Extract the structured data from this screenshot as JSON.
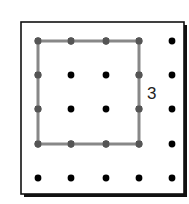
{
  "diagram": {
    "type": "dot-grid-square",
    "grid": {
      "rows": 5,
      "cols": 5,
      "xs": [
        38,
        71,
        106,
        139,
        172
      ],
      "ys": [
        41,
        75,
        109,
        144,
        178
      ],
      "dot_radius": 3.4,
      "dot_color": "#000000"
    },
    "frame": {
      "x": 21,
      "y": 22,
      "width": 163,
      "height": 172,
      "stroke": "#111111",
      "shadow_color": "#111111"
    },
    "square": {
      "from": {
        "col": 0,
        "row": 0
      },
      "to": {
        "col": 3,
        "row": 3
      },
      "stroke": "#888888",
      "stroke_width": 3,
      "side_length": 3
    },
    "label": {
      "text": "3",
      "x": 147,
      "y": 99,
      "font_size": 17,
      "color": "#222222"
    }
  }
}
